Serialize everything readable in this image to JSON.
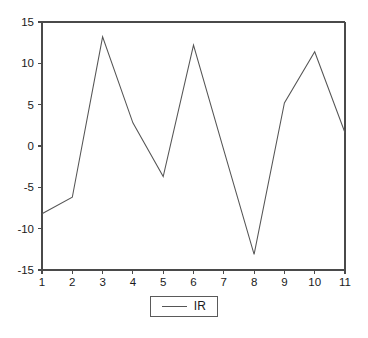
{
  "chart_data": {
    "type": "line",
    "title": "",
    "subtitle": "",
    "xlabel": "",
    "ylabel": "",
    "x": [
      1,
      2,
      3,
      4,
      5,
      6,
      7,
      8,
      9,
      10,
      11
    ],
    "categories": [
      "1",
      "2",
      "3",
      "4",
      "5",
      "6",
      "7",
      "8",
      "9",
      "10",
      "11"
    ],
    "series": [
      {
        "name": "IR",
        "values": [
          -8.2,
          -6.2,
          13.2,
          2.8,
          -3.7,
          12.2,
          -0.5,
          -13.1,
          5.2,
          11.4,
          1.6
        ],
        "color": "#555555"
      }
    ],
    "xlim": [
      1,
      11
    ],
    "ylim": [
      -15,
      15
    ],
    "x_ticks": [
      1,
      2,
      3,
      4,
      5,
      6,
      7,
      8,
      9,
      10,
      11
    ],
    "x_tick_labels": [
      "1",
      "2",
      "3",
      "4",
      "5",
      "6",
      "7",
      "8",
      "9",
      "10",
      "11"
    ],
    "y_ticks": [
      15,
      10,
      5,
      0,
      -5,
      -10,
      -15
    ],
    "y_tick_labels": [
      "15",
      "10",
      "5",
      "0",
      "-5",
      "-10",
      "-15"
    ],
    "grid": false,
    "legend_position": "bottom-center",
    "legend_entries": [
      "IR"
    ],
    "annotations": []
  },
  "legend": {
    "items": [
      {
        "label": "IR"
      }
    ]
  },
  "axes": {
    "y_labels": [
      "15",
      "10",
      "5",
      "0",
      "-5",
      "-10",
      "-15"
    ],
    "x_labels": [
      "1",
      "2",
      "3",
      "4",
      "5",
      "6",
      "7",
      "8",
      "9",
      "10",
      "11"
    ]
  }
}
